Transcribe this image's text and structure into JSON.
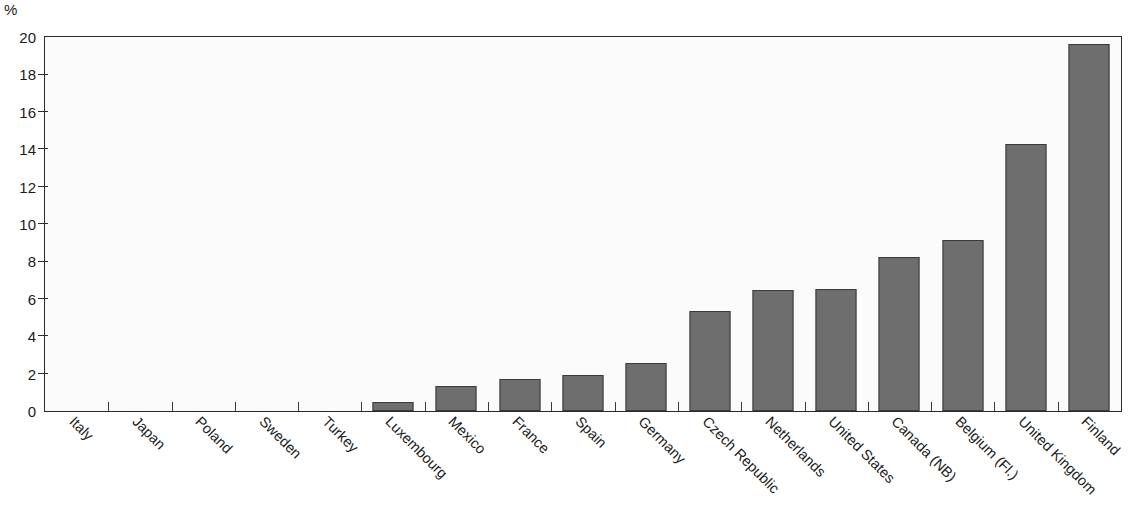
{
  "axis": {
    "unit_label": "%",
    "y_ticks": [
      "0",
      "2",
      "4",
      "6",
      "8",
      "10",
      "12",
      "14",
      "16",
      "18",
      "20"
    ],
    "y_min": 0,
    "y_max": 20,
    "y_step": 2
  },
  "colors": {
    "bar_fill": "#6e6e6e",
    "bar_stroke": "#3a3a3a",
    "frame": "#2b2b2b",
    "plot_background": "#fbfbfb",
    "text": "#1a1a1a"
  },
  "chart_data": {
    "type": "bar",
    "title": "",
    "subtitle": "",
    "xlabel": "",
    "ylabel": "%",
    "ylim": [
      0,
      20
    ],
    "ytick_step": 2,
    "grid": false,
    "legend": "none",
    "orientation": "vertical",
    "label_rotation_deg": 45,
    "categories": [
      "Italy",
      "Japan",
      "Poland",
      "Sweden",
      "Turkey",
      "Luxembourg",
      "Mexico",
      "France",
      "Spain",
      "Germany",
      "Czech Republic",
      "Netherlands",
      "United States",
      "Canada (NB)",
      "Belgium (Fl.)",
      "United Kingdom",
      "Finland"
    ],
    "values": [
      0,
      0,
      0,
      0,
      0,
      0.5,
      1.35,
      1.7,
      1.9,
      2.55,
      5.35,
      6.45,
      6.55,
      8.25,
      9.15,
      14.3,
      19.6
    ]
  }
}
